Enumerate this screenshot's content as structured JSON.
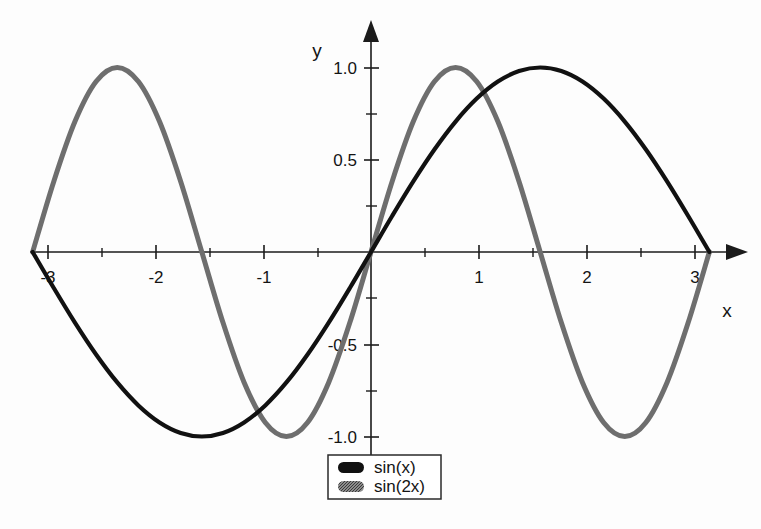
{
  "chart_data": {
    "type": "line",
    "title": "",
    "subtitle": "",
    "xlabel": "x",
    "ylabel": "y",
    "xlim": [
      -3.14159,
      3.14159
    ],
    "ylim": [
      -1.0,
      1.0
    ],
    "grid": false,
    "axis_style": "arrow-tipped cartesian axes crossing at origin",
    "legend_position": "bottom-center",
    "x_major_ticks": [
      -3,
      -2,
      -1,
      1,
      2,
      3
    ],
    "x_major_tick_labels": [
      "-3",
      "-2",
      "-1",
      "1",
      "2",
      "3"
    ],
    "x_minor_ticks": [
      -2.5,
      -1.5,
      -0.5,
      0.5,
      1.5,
      2.5
    ],
    "y_major_ticks": [
      1.0,
      0.5,
      -0.5,
      -1.0
    ],
    "y_major_tick_labels": [
      "1.0",
      "0.5",
      "-0.5",
      "-1.0"
    ],
    "y_minor_ticks": [
      0.75,
      0.25,
      -0.25,
      -0.75
    ],
    "series": [
      {
        "name": "sin(x)",
        "color": "#111111",
        "style": "solid-black",
        "expression": "sin(x)",
        "x": [
          -3.14159,
          -2.94524,
          -2.74889,
          -2.55254,
          -2.35619,
          -2.15984,
          -1.9635,
          -1.76715,
          -1.5708,
          -1.37445,
          -1.1781,
          -0.98175,
          -0.7854,
          -0.58905,
          -0.3927,
          -0.19635,
          0.0,
          0.19635,
          0.3927,
          0.58905,
          0.7854,
          0.98175,
          1.1781,
          1.37445,
          1.5708,
          1.76715,
          1.9635,
          2.15984,
          2.35619,
          2.55254,
          2.74889,
          2.94524,
          3.14159
        ],
        "y": [
          0.0,
          -0.19509,
          -0.38268,
          -0.55557,
          -0.70711,
          -0.83147,
          -0.92388,
          -0.98079,
          -1.0,
          -0.98079,
          -0.92388,
          -0.83147,
          -0.70711,
          -0.55557,
          -0.38268,
          -0.19509,
          0.0,
          0.19509,
          0.38268,
          0.55557,
          0.70711,
          0.83147,
          0.92388,
          0.98079,
          1.0,
          0.98079,
          0.92388,
          0.83147,
          0.70711,
          0.55557,
          0.38268,
          0.19509,
          0.0
        ]
      },
      {
        "name": "sin(2x)",
        "color": "#6e6e6e",
        "style": "solid-gray-dithered",
        "expression": "sin(2x)",
        "x": [
          -3.14159,
          -2.94524,
          -2.74889,
          -2.55254,
          -2.35619,
          -2.15984,
          -1.9635,
          -1.76715,
          -1.5708,
          -1.37445,
          -1.1781,
          -0.98175,
          -0.7854,
          -0.58905,
          -0.3927,
          -0.19635,
          0.0,
          0.19635,
          0.3927,
          0.58905,
          0.7854,
          0.98175,
          1.1781,
          1.37445,
          1.5708,
          1.76715,
          1.9635,
          2.15984,
          2.35619,
          2.55254,
          2.74889,
          2.94524,
          3.14159
        ],
        "y": [
          0.0,
          0.38268,
          0.70711,
          0.92388,
          1.0,
          0.92388,
          0.70711,
          0.38268,
          0.0,
          -0.38268,
          -0.70711,
          -0.92388,
          -1.0,
          -0.92388,
          -0.70711,
          -0.38268,
          0.0,
          0.38268,
          0.70711,
          0.92388,
          1.0,
          0.92388,
          0.70711,
          0.38268,
          0.0,
          -0.38268,
          -0.70711,
          -0.92388,
          -1.0,
          -0.92388,
          -0.70711,
          -0.38268,
          0.0
        ]
      }
    ],
    "annotations": []
  },
  "axes": {
    "x_label": "x",
    "y_label": "y",
    "x_ticks": [
      {
        "value": "-3"
      },
      {
        "value": "-2"
      },
      {
        "value": "-1"
      },
      {
        "value": "1"
      },
      {
        "value": "2"
      },
      {
        "value": "3"
      }
    ],
    "y_ticks": [
      {
        "value": "1.0"
      },
      {
        "value": "0.5"
      },
      {
        "value": "-0.5"
      },
      {
        "value": "-1.0"
      }
    ]
  },
  "legend": {
    "entries": [
      {
        "label": "sin(x)",
        "swatch": "black-capsule"
      },
      {
        "label": "sin(2x)",
        "swatch": "gray-capsule"
      }
    ]
  },
  "colors": {
    "background": "#fdfdfd",
    "axis": "#1b1b1b",
    "series_primary": "#111111",
    "series_secondary": "#6e6e6e",
    "legend_border": "#2a2a2a"
  }
}
